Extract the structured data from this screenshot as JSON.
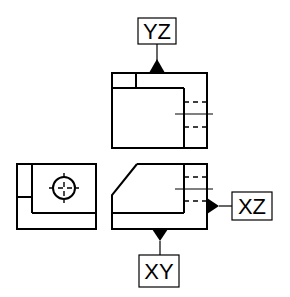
{
  "diagram": {
    "type": "orthographic-projection",
    "colors": {
      "line": "#000000",
      "background": "#ffffff"
    },
    "labels": {
      "yz": "YZ",
      "xz": "XZ",
      "xy": "XY"
    },
    "views": [
      {
        "name": "top-view",
        "reference_plane": "YZ"
      },
      {
        "name": "front-view",
        "reference_plane": "XZ / XY"
      },
      {
        "name": "side-view"
      }
    ]
  }
}
